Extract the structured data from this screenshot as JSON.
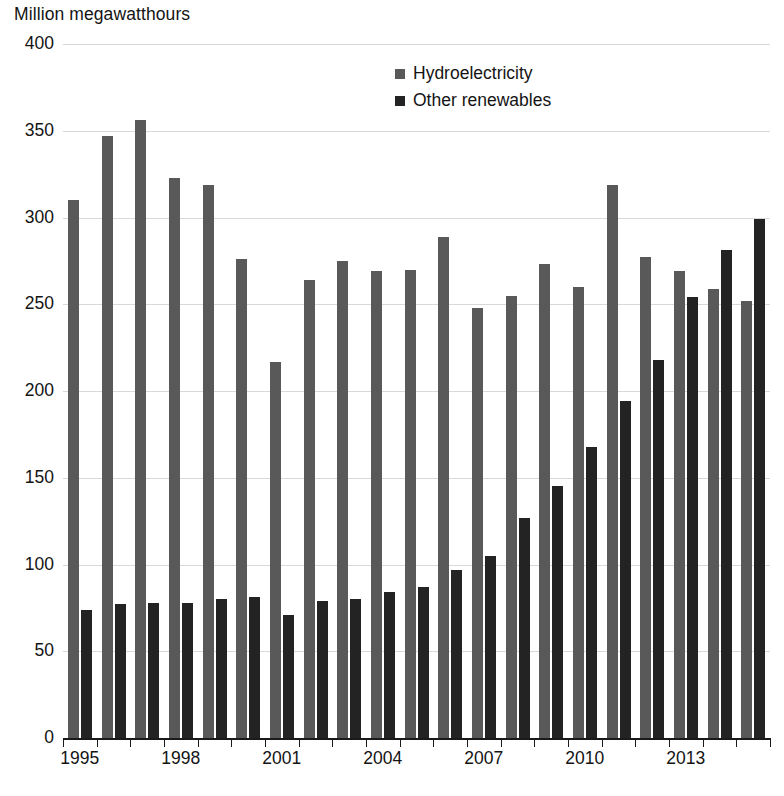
{
  "chart_data": {
    "type": "bar",
    "title": "Million megawatthours",
    "xlabel": "",
    "ylabel": "Million megawatthours",
    "ylim": [
      0,
      400
    ],
    "ytick_step": 50,
    "yticks": [
      0,
      50,
      100,
      150,
      200,
      250,
      300,
      350,
      400
    ],
    "grid": true,
    "legend_position": "top-center",
    "categories": [
      "1995",
      "1996",
      "1997",
      "1998",
      "1999",
      "2000",
      "2001",
      "2002",
      "2003",
      "2004",
      "2005",
      "2006",
      "2007",
      "2008",
      "2009",
      "2010",
      "2011",
      "2012",
      "2013",
      "2014",
      "2015"
    ],
    "xtick_labels": [
      "1995",
      "1998",
      "2001",
      "2004",
      "2007",
      "2010",
      "2013"
    ],
    "series": [
      {
        "name": "Hydroelectricity",
        "color": "#595959",
        "values": [
          310,
          347,
          356,
          323,
          319,
          276,
          217,
          264,
          275,
          269,
          270,
          289,
          248,
          255,
          273,
          260,
          319,
          277,
          269,
          259,
          252
        ]
      },
      {
        "name": "Other renewables",
        "color": "#232323",
        "values": [
          74,
          77,
          78,
          78,
          80,
          81,
          71,
          79,
          80,
          84,
          87,
          97,
          105,
          127,
          145,
          168,
          194,
          218,
          254,
          281,
          299
        ]
      }
    ]
  }
}
